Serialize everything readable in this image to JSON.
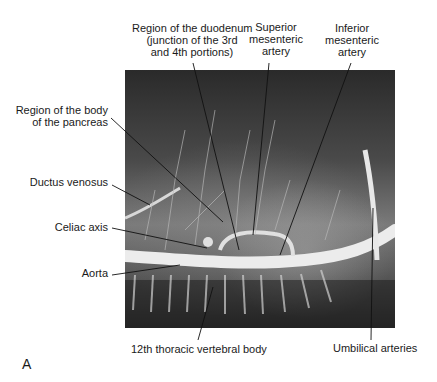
{
  "figure": {
    "panel_letter": "A",
    "image_description": "Postmortem arteriogram showing aorta and its major branches",
    "labels": {
      "duodenum": [
        "Region of the duodenum",
        "(junction of the 3rd",
        "and 4th portions)"
      ],
      "superior_mesenteric": [
        "Superior",
        "mesenteric",
        "artery"
      ],
      "inferior_mesenteric": [
        "Inferior",
        "mesenteric",
        "artery"
      ],
      "pancreas": [
        "Region of the body",
        "of the pancreas"
      ],
      "ductus_venosus": "Ductus venosus",
      "celiac_axis": "Celiac axis",
      "aorta": "Aorta",
      "thoracic_vertebra": "12th thoracic vertebral body",
      "umbilical_arteries": "Umbilical arteries"
    },
    "colors": {
      "background": "#ffffff",
      "text": "#1a1a1a",
      "leader_line": "#111111",
      "vessel": "#e8e8e8"
    }
  }
}
